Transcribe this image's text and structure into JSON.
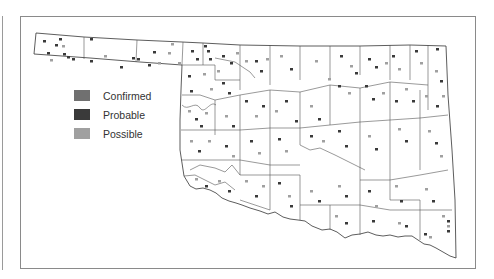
{
  "map": {
    "region": "Oklahoma counties",
    "colors": {
      "confirmed": "#707070",
      "probable": "#3a3a3a",
      "possible": "#a0a0a0",
      "border": "#333333"
    }
  },
  "legend": {
    "items": [
      {
        "label": "Confirmed",
        "color": "#707070"
      },
      {
        "label": "Probable",
        "color": "#3a3a3a"
      },
      {
        "label": "Possible",
        "color": "#a0a0a0"
      }
    ]
  }
}
